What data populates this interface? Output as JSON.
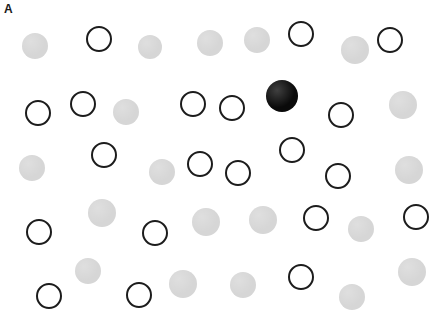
{
  "panel": {
    "label": "A",
    "width": 442,
    "height": 317,
    "background_color": "#ffffff"
  },
  "legend": {
    "target_color": "#0a0a0a",
    "distractor_filled_color": "#d6d6d6",
    "distractor_outline_color": "#1c1c1c",
    "target_count": 1,
    "distractor_filled_count": 20,
    "distractor_open_count": 19,
    "total_items": 40
  },
  "items": [
    {
      "name": "distractor-filled-1",
      "type": "filled",
      "cx": 35,
      "cy": 46,
      "r": 13
    },
    {
      "name": "distractor-open-1",
      "type": "open",
      "cx": 99,
      "cy": 39,
      "r": 13
    },
    {
      "name": "distractor-filled-2",
      "type": "filled",
      "cx": 150,
      "cy": 47,
      "r": 12
    },
    {
      "name": "distractor-filled-3",
      "type": "filled",
      "cx": 210,
      "cy": 43,
      "r": 13
    },
    {
      "name": "distractor-filled-4",
      "type": "filled",
      "cx": 257,
      "cy": 40,
      "r": 13
    },
    {
      "name": "distractor-open-2",
      "type": "open",
      "cx": 301,
      "cy": 34,
      "r": 13
    },
    {
      "name": "distractor-filled-5",
      "type": "filled",
      "cx": 355,
      "cy": 50,
      "r": 14
    },
    {
      "name": "distractor-open-3",
      "type": "open",
      "cx": 390,
      "cy": 40,
      "r": 13
    },
    {
      "name": "distractor-open-4",
      "type": "open",
      "cx": 38,
      "cy": 113,
      "r": 13
    },
    {
      "name": "distractor-open-5",
      "type": "open",
      "cx": 83,
      "cy": 104,
      "r": 13
    },
    {
      "name": "distractor-filled-6",
      "type": "filled",
      "cx": 126,
      "cy": 112,
      "r": 13
    },
    {
      "name": "distractor-open-6",
      "type": "open",
      "cx": 193,
      "cy": 104,
      "r": 13
    },
    {
      "name": "distractor-open-7",
      "type": "open",
      "cx": 232,
      "cy": 108,
      "r": 13
    },
    {
      "name": "target-black",
      "type": "target",
      "cx": 282,
      "cy": 96,
      "r": 16
    },
    {
      "name": "distractor-open-8",
      "type": "open",
      "cx": 341,
      "cy": 115,
      "r": 13
    },
    {
      "name": "distractor-filled-7",
      "type": "filled",
      "cx": 403,
      "cy": 105,
      "r": 14
    },
    {
      "name": "distractor-filled-8",
      "type": "filled",
      "cx": 32,
      "cy": 168,
      "r": 13
    },
    {
      "name": "distractor-open-9",
      "type": "open",
      "cx": 104,
      "cy": 155,
      "r": 13
    },
    {
      "name": "distractor-filled-9",
      "type": "filled",
      "cx": 162,
      "cy": 172,
      "r": 13
    },
    {
      "name": "distractor-open-10",
      "type": "open",
      "cx": 200,
      "cy": 164,
      "r": 13
    },
    {
      "name": "distractor-open-11",
      "type": "open",
      "cx": 238,
      "cy": 173,
      "r": 13
    },
    {
      "name": "distractor-open-12",
      "type": "open",
      "cx": 292,
      "cy": 150,
      "r": 13
    },
    {
      "name": "distractor-open-13",
      "type": "open",
      "cx": 338,
      "cy": 176,
      "r": 13
    },
    {
      "name": "distractor-filled-10",
      "type": "filled",
      "cx": 409,
      "cy": 170,
      "r": 14
    },
    {
      "name": "distractor-open-14",
      "type": "open",
      "cx": 39,
      "cy": 232,
      "r": 13
    },
    {
      "name": "distractor-filled-11",
      "type": "filled",
      "cx": 102,
      "cy": 213,
      "r": 14
    },
    {
      "name": "distractor-open-15",
      "type": "open",
      "cx": 155,
      "cy": 233,
      "r": 13
    },
    {
      "name": "distractor-filled-12",
      "type": "filled",
      "cx": 206,
      "cy": 222,
      "r": 14
    },
    {
      "name": "distractor-filled-13",
      "type": "filled",
      "cx": 263,
      "cy": 220,
      "r": 14
    },
    {
      "name": "distractor-open-16",
      "type": "open",
      "cx": 316,
      "cy": 218,
      "r": 13
    },
    {
      "name": "distractor-filled-14",
      "type": "filled",
      "cx": 361,
      "cy": 229,
      "r": 13
    },
    {
      "name": "distractor-open-17",
      "type": "open",
      "cx": 416,
      "cy": 217,
      "r": 13
    },
    {
      "name": "distractor-open-18",
      "type": "open",
      "cx": 49,
      "cy": 296,
      "r": 13
    },
    {
      "name": "distractor-filled-15",
      "type": "filled",
      "cx": 88,
      "cy": 271,
      "r": 13
    },
    {
      "name": "distractor-open-19",
      "type": "open",
      "cx": 139,
      "cy": 295,
      "r": 13
    },
    {
      "name": "distractor-filled-16",
      "type": "filled",
      "cx": 183,
      "cy": 284,
      "r": 14
    },
    {
      "name": "distractor-filled-17",
      "type": "filled",
      "cx": 243,
      "cy": 285,
      "r": 13
    },
    {
      "name": "distractor-open-20",
      "type": "open",
      "cx": 301,
      "cy": 277,
      "r": 13
    },
    {
      "name": "distractor-filled-18",
      "type": "filled",
      "cx": 352,
      "cy": 297,
      "r": 13
    },
    {
      "name": "distractor-filled-19",
      "type": "filled",
      "cx": 412,
      "cy": 272,
      "r": 14
    }
  ]
}
